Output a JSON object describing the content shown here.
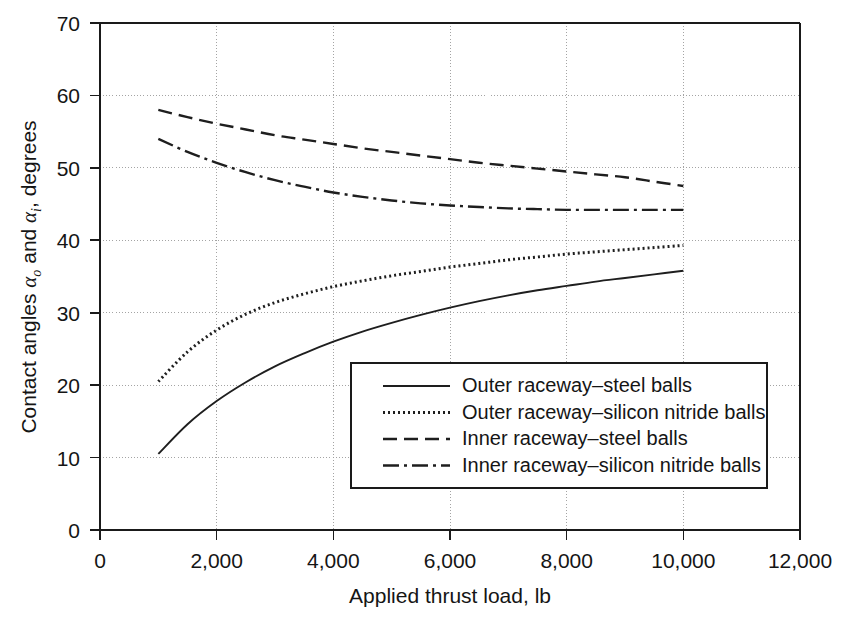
{
  "chart_data": {
    "type": "line",
    "title": "",
    "xlabel": "Applied thrust load, lb",
    "ylabel": "Contact angles αo and αi, degrees",
    "ylabel_parts": {
      "prefix": "Contact angles ",
      "symbol1": "α",
      "sub1": "o",
      "middle": " and ",
      "symbol2": "α",
      "sub2": "i",
      "suffix": ", degrees"
    },
    "xlim": [
      0,
      12000
    ],
    "ylim": [
      0,
      70
    ],
    "xticks": [
      0,
      2000,
      4000,
      6000,
      8000,
      10000,
      12000
    ],
    "xtick_labels": [
      "0",
      "2,000",
      "4,000",
      "6,000",
      "8,000",
      "10,000",
      "12,000"
    ],
    "yticks": [
      0,
      10,
      20,
      30,
      40,
      50,
      60,
      70
    ],
    "ytick_labels": [
      "0",
      "10",
      "20",
      "30",
      "40",
      "50",
      "60",
      "70"
    ],
    "grid": true,
    "grid_style": "dotted",
    "legend_position": "lower-right-inside",
    "series": [
      {
        "name": "Outer raceway–steel balls",
        "style": "solid",
        "dash": "none",
        "x": [
          1000,
          1500,
          2000,
          2500,
          3000,
          3500,
          4000,
          4500,
          5000,
          5500,
          6000,
          6500,
          7000,
          7500,
          8000,
          8500,
          9000,
          9500,
          10000
        ],
        "y": [
          10.5,
          14.6,
          17.8,
          20.4,
          22.6,
          24.4,
          26.0,
          27.4,
          28.6,
          29.7,
          30.7,
          31.6,
          32.4,
          33.1,
          33.7,
          34.3,
          34.8,
          35.3,
          35.8
        ]
      },
      {
        "name": "Outer raceway–silicon nitride balls",
        "style": "dotted",
        "dash": "2 3",
        "x": [
          1000,
          1500,
          2000,
          2500,
          3000,
          3500,
          4000,
          4500,
          5000,
          5500,
          6000,
          6500,
          7000,
          7500,
          8000,
          8500,
          9000,
          9500,
          10000
        ],
        "y": [
          20.5,
          24.6,
          27.6,
          29.8,
          31.4,
          32.6,
          33.6,
          34.4,
          35.1,
          35.7,
          36.3,
          36.8,
          37.3,
          37.7,
          38.1,
          38.4,
          38.7,
          39.0,
          39.3
        ]
      },
      {
        "name": "Inner raceway–steel balls",
        "style": "dashed",
        "dash": "14 7",
        "x": [
          1000,
          1500,
          2000,
          2500,
          3000,
          3500,
          4000,
          4500,
          5000,
          5500,
          6000,
          6500,
          7000,
          7500,
          8000,
          8500,
          9000,
          9500,
          10000
        ],
        "y": [
          58.0,
          57.0,
          56.1,
          55.3,
          54.5,
          53.9,
          53.3,
          52.7,
          52.2,
          51.7,
          51.2,
          50.7,
          50.3,
          49.9,
          49.5,
          49.1,
          48.7,
          48.1,
          47.5
        ]
      },
      {
        "name": "Inner raceway–silicon nitride balls",
        "style": "dash-dot",
        "dash": "16 5 3 5",
        "x": [
          1000,
          1500,
          2000,
          2500,
          3000,
          3500,
          4000,
          4500,
          5000,
          5500,
          6000,
          6500,
          7000,
          7500,
          8000,
          8500,
          9000,
          9500,
          10000
        ],
        "y": [
          54.0,
          52.2,
          50.7,
          49.4,
          48.3,
          47.4,
          46.6,
          46.0,
          45.5,
          45.1,
          44.8,
          44.6,
          44.4,
          44.3,
          44.2,
          44.2,
          44.2,
          44.2,
          44.2
        ]
      }
    ]
  },
  "legend": {
    "items": [
      {
        "label": "Outer raceway–steel balls",
        "style": "solid"
      },
      {
        "label": "Outer raceway–silicon nitride balls",
        "style": "dotted"
      },
      {
        "label": "Inner raceway–steel balls",
        "style": "dashed"
      },
      {
        "label": "Inner raceway–silicon nitride balls",
        "style": "dash-dot"
      }
    ]
  },
  "colors": {
    "line": "#1e1e1e",
    "axis": "#1a1a1a",
    "grid": "#9a9a9a",
    "background": "#ffffff",
    "text": "#151515"
  }
}
